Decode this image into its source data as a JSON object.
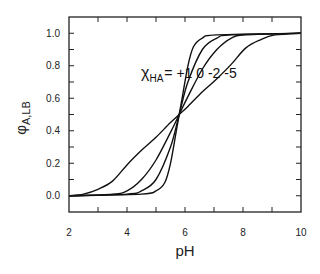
{
  "chart_data": {
    "type": "line",
    "title": "",
    "xlabel": "pH",
    "ylabel": "φ_A,LB",
    "ylabel_main": "φ",
    "ylabel_sub": "A,LB",
    "xlim": [
      2,
      10
    ],
    "ylim": [
      -0.1,
      1.1
    ],
    "x_ticks": [
      2,
      4,
      6,
      8,
      10
    ],
    "x_minor_ticks": [
      3,
      5,
      7,
      9
    ],
    "y_ticks": [
      0.0,
      0.2,
      0.4,
      0.6,
      0.8,
      1.0
    ],
    "y_tick_labels": [
      "0.0",
      "0.2",
      "0.4",
      "0.6",
      "0.8",
      "1.0"
    ],
    "x_tick_labels": [
      "2",
      "4",
      "6",
      "8",
      "10"
    ],
    "grid": false,
    "legend": null,
    "annotation": {
      "symbol": "χ",
      "subscript": "HA",
      "text": "= +1 0 -2 -5"
    },
    "crossing_point": {
      "x": 5.8,
      "y": 0.5
    },
    "series": [
      {
        "name": "χ_HA = +1",
        "x": [
          2,
          4.5,
          5.0,
          5.3,
          5.5,
          5.7,
          5.8,
          5.9,
          6.1,
          6.3,
          6.6,
          7.1,
          10
        ],
        "y": [
          0.0,
          0.01,
          0.03,
          0.08,
          0.2,
          0.4,
          0.5,
          0.6,
          0.8,
          0.92,
          0.97,
          0.99,
          1.0
        ]
      },
      {
        "name": "χ_HA = 0",
        "x": [
          2,
          4.0,
          4.5,
          5.0,
          5.5,
          5.8,
          6.1,
          6.6,
          7.1,
          7.6,
          10
        ],
        "y": [
          0.0,
          0.01,
          0.03,
          0.1,
          0.3,
          0.5,
          0.7,
          0.9,
          0.97,
          0.99,
          1.0
        ]
      },
      {
        "name": "χ_HA = -2",
        "x": [
          2,
          3.5,
          4.0,
          4.5,
          5.0,
          5.5,
          5.8,
          6.1,
          6.6,
          7.1,
          7.6,
          8.1,
          10
        ],
        "y": [
          0.0,
          0.01,
          0.03,
          0.1,
          0.22,
          0.39,
          0.5,
          0.61,
          0.78,
          0.9,
          0.97,
          0.99,
          1.0
        ]
      },
      {
        "name": "χ_HA = -5",
        "x": [
          2,
          2.5,
          3.0,
          3.5,
          4.0,
          4.5,
          5.0,
          5.5,
          5.8,
          6.1,
          6.6,
          7.1,
          7.6,
          8.1,
          8.6,
          9.1,
          10
        ],
        "y": [
          0.0,
          0.01,
          0.04,
          0.09,
          0.19,
          0.28,
          0.36,
          0.45,
          0.5,
          0.55,
          0.64,
          0.72,
          0.81,
          0.91,
          0.96,
          0.99,
          1.0
        ]
      }
    ]
  }
}
